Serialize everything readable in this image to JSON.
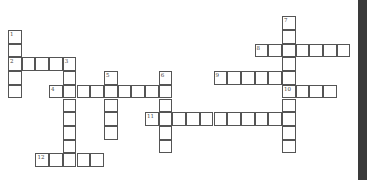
{
  "puzzle": {
    "cell_size": 13.7,
    "origin_x": 8,
    "origin_y": 30,
    "words": [
      {
        "number": "1",
        "direction": "down",
        "row": 0,
        "col": 0,
        "length": 5
      },
      {
        "number": "2",
        "direction": "across",
        "row": 2,
        "col": 0,
        "length": 5
      },
      {
        "number": "3",
        "direction": "down",
        "row": 2,
        "col": 4,
        "length": 8
      },
      {
        "number": "4",
        "direction": "across",
        "row": 4,
        "col": 3,
        "length": 9
      },
      {
        "number": "5",
        "direction": "down",
        "row": 3,
        "col": 7,
        "length": 5
      },
      {
        "number": "6",
        "direction": "down",
        "row": 3,
        "col": 11,
        "length": 6
      },
      {
        "number": "7",
        "direction": "down",
        "row": -1,
        "col": 20,
        "length": 10
      },
      {
        "number": "8",
        "direction": "across",
        "row": 1,
        "col": 18,
        "length": 7
      },
      {
        "number": "9",
        "direction": "across",
        "row": 3,
        "col": 15,
        "length": 6
      },
      {
        "number": "10",
        "direction": "across",
        "row": 4,
        "col": 20,
        "length": 4
      },
      {
        "number": "11",
        "direction": "across",
        "row": 6,
        "col": 10,
        "length": 11
      },
      {
        "number": "12",
        "direction": "across",
        "row": 9,
        "col": 2,
        "length": 5
      }
    ]
  }
}
